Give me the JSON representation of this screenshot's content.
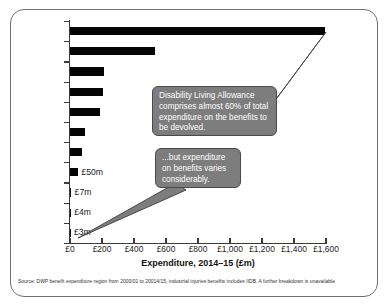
{
  "chart_data": {
    "type": "bar",
    "orientation": "horizontal",
    "title": "",
    "xlabel": "Expenditure, 2014–15 (£m)",
    "ylabel": "",
    "xlim": [
      0,
      1600
    ],
    "xticks": [
      0,
      200,
      400,
      600,
      800,
      1000,
      1200,
      1400,
      1600
    ],
    "xticklabels": [
      "£0",
      "£200",
      "£400",
      "£600",
      "£800",
      "£1,000",
      "£1,200",
      "£1,400",
      "£1,600"
    ],
    "grid": false,
    "legend": "none",
    "categories": [
      "Disability Living Allowance",
      "Attendance Allowance",
      "Carer's Allowance",
      "Personal Independence Payment",
      "Industrial Injuries Benefits",
      "Severe Disablement Allowance",
      "Winter Fuel Payments",
      "Cold Weather Payments",
      "Discretionary Housing Payments",
      "Sure Start Maternity Grant",
      "Funeral Payments"
    ],
    "values": [
      1595,
      530,
      215,
      205,
      185,
      95,
      75,
      50,
      7,
      4,
      3
    ],
    "annotations": [
      {
        "label": "£50m",
        "value": 50
      },
      {
        "label": "£7m",
        "value": 7
      },
      {
        "label": "£4m",
        "value": 4
      },
      {
        "label": "£3m",
        "value": 3
      }
    ],
    "bar_color": "#050505",
    "callout_color": "#7d7d7d"
  },
  "callouts": [
    {
      "id": "dla",
      "text": "Disability Living Allowance comprises almost 60% of total expenditure on the benefits to be devolved."
    },
    {
      "id": "varies",
      "text": "...but expenditure on benefits varies considerably."
    }
  ],
  "source": {
    "note": "Source: DWP benefit expenditure region from 2000/01 to 20014/15, industrial injuries benefits includes IIDB. A further breakdown is unavailable."
  }
}
